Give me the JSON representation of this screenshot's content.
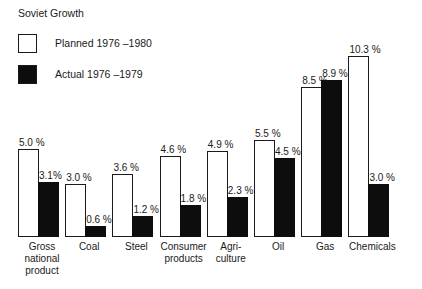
{
  "chart_data": {
    "type": "bar",
    "title": "Soviet Growth",
    "xlabel": "",
    "ylabel": "",
    "ylim": [
      0,
      10.8
    ],
    "grid": false,
    "legend_position": "top-left",
    "value_suffix": "%",
    "categories": [
      "Gross national product",
      "Coal",
      "Steel",
      "Consumer products",
      "Agriculture",
      "Oil",
      "Gas",
      "Chemicals"
    ],
    "category_lines": [
      [
        "Gross",
        "national",
        "product"
      ],
      [
        "Coal"
      ],
      [
        "Steel"
      ],
      [
        "Consumer",
        "products"
      ],
      [
        "Agri-",
        "culture"
      ],
      [
        "Oil"
      ],
      [
        "Gas"
      ],
      [
        "Chemicals"
      ]
    ],
    "series": [
      {
        "name": "Planned 1976 –1980",
        "color": "#ffffff",
        "values": [
          5.0,
          3.0,
          3.6,
          4.6,
          4.9,
          5.5,
          8.5,
          10.3
        ],
        "labels": [
          "5.0 %",
          "3.0 %",
          "3.6 %",
          "4.6 %",
          "4.9 %",
          "5.5 %",
          "8.5 %",
          "10.3 %"
        ]
      },
      {
        "name": "Actual 1976 –1979",
        "color": "#0d0d0d",
        "values": [
          3.1,
          0.6,
          1.2,
          1.8,
          2.3,
          4.5,
          8.9,
          3.0
        ],
        "labels": [
          "3.1%",
          "0.6 %",
          "1.2 %",
          "1.8 %",
          "2.3 %",
          "4.5 %",
          "8.9 %",
          "3.0 %"
        ]
      }
    ]
  },
  "legend": {
    "items": [
      {
        "label": "Planned 1976 –1980",
        "swatch": "planned"
      },
      {
        "label": "Actual 1976 –1979",
        "swatch": "actual"
      }
    ]
  }
}
